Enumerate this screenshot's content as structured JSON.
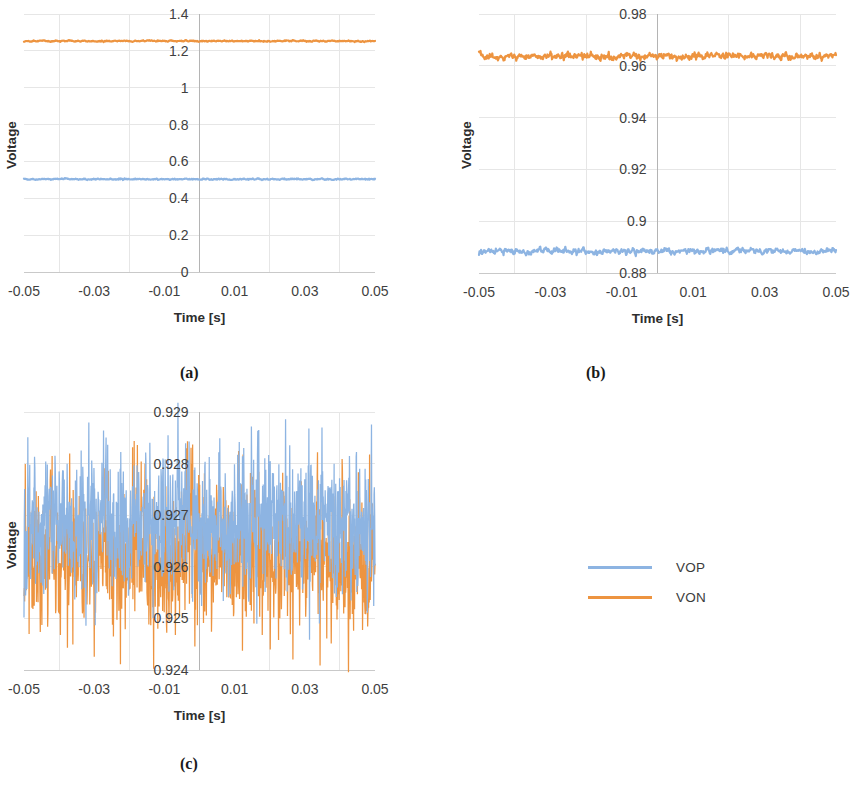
{
  "figure": {
    "panels": [
      {
        "id": "a",
        "caption": "(a)"
      },
      {
        "id": "b",
        "caption": "(b)"
      },
      {
        "id": "c",
        "caption": "(c)"
      }
    ]
  },
  "legend": {
    "entries": [
      {
        "label": "VOP",
        "color": "#8db4e2"
      },
      {
        "label": "VON",
        "color": "#ed9440"
      }
    ]
  },
  "colors": {
    "vop": "#8db4e2",
    "von": "#ed9440",
    "grid": "#e6e6e6",
    "axis": "#c9c9c9",
    "text": "#3f3f3f"
  },
  "chart_data": [
    {
      "id": "a",
      "type": "line",
      "title": "",
      "xlabel": "Time [s]",
      "ylabel": "Voltage",
      "xlim": [
        -0.05,
        0.05
      ],
      "ylim": [
        0,
        1.4
      ],
      "xticks": [
        -0.05,
        -0.03,
        -0.01,
        0.01,
        0.03,
        0.05
      ],
      "xtick_labels": [
        "-0.05",
        "-0.03",
        "-0.01",
        "0.01",
        "0.03",
        "0.05"
      ],
      "yticks": [
        0,
        0.2,
        0.4,
        0.6,
        0.8,
        1,
        1.2,
        1.4
      ],
      "ytick_labels": [
        "0",
        "0.2",
        "0.4",
        "0.6",
        "0.8",
        "1",
        "1.2",
        "1.4"
      ],
      "grid": true,
      "legend_position": "none",
      "series": [
        {
          "name": "VOP",
          "color": "#8db4e2",
          "mean": 0.5035,
          "noise": 0.0035,
          "samples": 640,
          "seed": 11
        },
        {
          "name": "VON",
          "color": "#ed9440",
          "mean": 1.253,
          "noise": 0.0035,
          "samples": 640,
          "seed": 23
        }
      ]
    },
    {
      "id": "b",
      "type": "line",
      "title": "",
      "xlabel": "Time [s]",
      "ylabel": "Voltage",
      "xlim": [
        -0.05,
        0.05
      ],
      "ylim": [
        0.88,
        0.98
      ],
      "xticks": [
        -0.05,
        -0.03,
        -0.01,
        0.01,
        0.03,
        0.05
      ],
      "xtick_labels": [
        "-0.05",
        "-0.03",
        "-0.01",
        "0.01",
        "0.03",
        "0.05"
      ],
      "yticks": [
        0.88,
        0.9,
        0.92,
        0.94,
        0.96,
        0.98
      ],
      "ytick_labels": [
        "0.88",
        "0.9",
        "0.92",
        "0.94",
        "0.96",
        "0.98"
      ],
      "grid": true,
      "legend_position": "none",
      "series": [
        {
          "name": "VOP",
          "color": "#8db4e2",
          "mean": 0.8885,
          "noise": 0.0011,
          "samples": 700,
          "seed": 37
        },
        {
          "name": "VON",
          "color": "#ed9440",
          "mean": 0.9637,
          "noise": 0.0013,
          "samples": 700,
          "seed": 59
        }
      ]
    },
    {
      "id": "c",
      "type": "line",
      "title": "",
      "xlabel": "Time [s]",
      "ylabel": "Voltage",
      "xlim": [
        -0.05,
        0.05
      ],
      "ylim": [
        0.924,
        0.929
      ],
      "xticks": [
        -0.05,
        -0.03,
        -0.01,
        0.01,
        0.03,
        0.05
      ],
      "xtick_labels": [
        "-0.05",
        "-0.03",
        "-0.01",
        "0.01",
        "0.03",
        "0.05"
      ],
      "yticks": [
        0.924,
        0.925,
        0.926,
        0.927,
        0.928,
        0.929
      ],
      "ytick_labels": [
        "0.924",
        "0.925",
        "0.926",
        "0.927",
        "0.928",
        "0.929"
      ],
      "grid": true,
      "legend_position": "none",
      "series": [
        {
          "name": "VON",
          "color": "#ed9440",
          "mean": 0.92625,
          "noise": 0.00072,
          "samples": 1100,
          "seed": 83
        },
        {
          "name": "VOP",
          "color": "#8db4e2",
          "mean": 0.92685,
          "noise": 0.00068,
          "samples": 1100,
          "seed": 101
        }
      ]
    }
  ]
}
